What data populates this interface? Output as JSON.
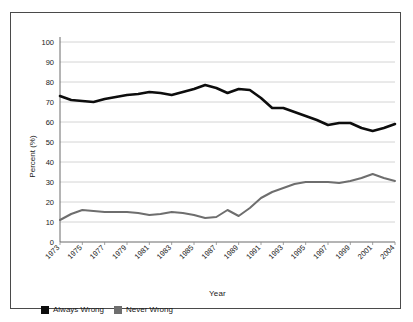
{
  "chart_data": {
    "type": "line",
    "title": "",
    "xlabel": "Year",
    "ylabel": "Percent (%)",
    "ylim": [
      0,
      100
    ],
    "ytick_values": [
      0,
      10,
      20,
      30,
      40,
      50,
      60,
      70,
      80,
      90,
      100
    ],
    "ytick_labels": [
      "0",
      "10",
      "20",
      "30",
      "40",
      "50",
      "60",
      "70",
      "80",
      "90",
      "100"
    ],
    "grid": true,
    "grid_axis": "y",
    "legend_position": "below-axes-left",
    "categories": [
      "1973",
      "1974",
      "1975",
      "1976",
      "1977",
      "1978",
      "1979",
      "1980",
      "1981",
      "1982",
      "1983",
      "1984",
      "1985",
      "1986",
      "1987",
      "1988",
      "1989",
      "1990",
      "1991",
      "1992",
      "1993",
      "1994",
      "1995",
      "1996",
      "1997",
      "1998",
      "1999",
      "2000",
      "2001",
      "2002",
      "2004"
    ],
    "xtick_labels": [
      "1973",
      "1975",
      "1977",
      "1979",
      "1981",
      "1983",
      "1985",
      "1987",
      "1989",
      "1991",
      "1993",
      "1995",
      "1997",
      "1999",
      "2001",
      "2004"
    ],
    "series": [
      {
        "name": "Always Wrong",
        "color": "#0d0d0d",
        "values": [
          73,
          71,
          70.5,
          70,
          71.5,
          72.5,
          73.5,
          74,
          75,
          74.5,
          73.5,
          75,
          76.5,
          78.5,
          77,
          74.5,
          76.5,
          76,
          72,
          67,
          67,
          65,
          63,
          61,
          58.5,
          59.5,
          59.5,
          57,
          55.5,
          57,
          59
        ]
      },
      {
        "name": "Never Wrong",
        "color": "#6e6e6e",
        "values": [
          11,
          14,
          16,
          15.5,
          15,
          15,
          15,
          14.5,
          13.5,
          14,
          15,
          14.5,
          13.5,
          12,
          12.5,
          16,
          13,
          17,
          22,
          25,
          27,
          29,
          30,
          30,
          30,
          29.5,
          30.5,
          32,
          34,
          32,
          30.5
        ]
      }
    ]
  },
  "legend": {
    "items": [
      {
        "label": "Always Wrong",
        "color": "#0d0d0d"
      },
      {
        "label": "Never Wrong",
        "color": "#6e6e6e"
      }
    ]
  }
}
